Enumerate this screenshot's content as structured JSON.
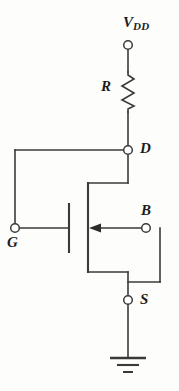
{
  "figure": {
    "background_color": "#fdfdfb",
    "line_color": "#3a3a3a"
  },
  "labels": {
    "supply_main": "V",
    "supply_sub": "DD",
    "resistor": "R",
    "drain": "D",
    "body": "B",
    "gate": "G",
    "source": "S"
  },
  "components": {
    "resistor": {
      "name": "R",
      "symbol": "zigzag",
      "orientation": "vertical"
    },
    "transistor": {
      "type": "n-channel MOSFET",
      "arrow_direction": "left",
      "terminals": [
        "D",
        "G",
        "S",
        "B"
      ]
    },
    "ground": {
      "symbol": "earth-ground",
      "bars": 3
    }
  },
  "nodes": [
    {
      "name": "VDD",
      "label": "V DD"
    },
    {
      "name": "D",
      "label": "D"
    },
    {
      "name": "G",
      "label": "G"
    },
    {
      "name": "B",
      "label": "B"
    },
    {
      "name": "S",
      "label": "S"
    }
  ]
}
